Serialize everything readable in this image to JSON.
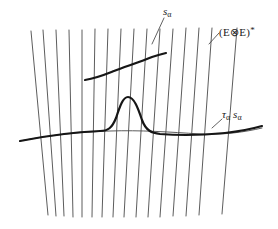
{
  "figure": {
    "background_color": "#ffffff",
    "fiber_line_color": "#4a4a4a",
    "curve_color": "#161616",
    "label_color": "#1a1a1a"
  },
  "labels": {
    "section": {
      "name": "s-alpha",
      "base": "s",
      "subscript": "α"
    },
    "bundle": {
      "name": "tensor-dual-bundle",
      "open_paren": "(",
      "first": "E",
      "tensor": "⊗",
      "second": "E",
      "close_paren": ")",
      "star": "*",
      "full": "(E ⊗ E)*"
    },
    "transformed_section": {
      "name": "tau-alpha-s-alpha",
      "tau": "τ",
      "tau_subscript": "α",
      "s": "s",
      "s_subscript": "α",
      "full": "τα sα"
    }
  },
  "geometry": {
    "fibers": [
      {
        "x_top": 31,
        "y_top": 31,
        "x_bottom": 48,
        "y_bottom": 215
      },
      {
        "x_top": 43,
        "y_top": 30,
        "x_bottom": 56,
        "y_bottom": 216
      },
      {
        "x_top": 56,
        "y_top": 30,
        "x_bottom": 64,
        "y_bottom": 216
      },
      {
        "x_top": 69,
        "y_top": 30,
        "x_bottom": 73,
        "y_bottom": 217
      },
      {
        "x_top": 82,
        "y_top": 30,
        "x_bottom": 82,
        "y_bottom": 217
      },
      {
        "x_top": 95,
        "y_top": 29,
        "x_bottom": 92,
        "y_bottom": 217
      },
      {
        "x_top": 108,
        "y_top": 29,
        "x_bottom": 102,
        "y_bottom": 217
      },
      {
        "x_top": 121,
        "y_top": 29,
        "x_bottom": 113,
        "y_bottom": 217
      },
      {
        "x_top": 134,
        "y_top": 29,
        "x_bottom": 124,
        "y_bottom": 217
      },
      {
        "x_top": 147,
        "y_top": 29,
        "x_bottom": 136,
        "y_bottom": 217
      },
      {
        "x_top": 160,
        "y_top": 29,
        "x_bottom": 148,
        "y_bottom": 217
      },
      {
        "x_top": 173,
        "y_top": 29,
        "x_bottom": 160,
        "y_bottom": 217
      },
      {
        "x_top": 186,
        "y_top": 28,
        "x_bottom": 173,
        "y_bottom": 216
      },
      {
        "x_top": 199,
        "y_top": 28,
        "x_bottom": 186,
        "y_bottom": 216
      },
      {
        "x_top": 212,
        "y_top": 28,
        "x_bottom": 199,
        "y_bottom": 215
      },
      {
        "x_top": 237,
        "y_top": 28,
        "x_bottom": 222,
        "y_bottom": 214
      }
    ],
    "section_curve": "M 85,80 C 97,78 104,75 114,71 C 124,67 140,62 152,57 C 158,55 162,54 166,53",
    "base_thin_curve": "M 20,141 C 50,135 80,132 110,131 C 140,130 170,132 200,134 C 225,135 245,132 262,128",
    "bump_curve": "M 20,141 C 50,135 78,132 100,131 C 108,131 112,128 116,118 C 120,106 123,97 128,97 C 134,97 138,108 142,120 C 146,131 152,133 160,134 C 185,136 205,135 225,133 C 242,131 255,128 262,126",
    "leaders": [
      {
        "name": "s-alpha-leader",
        "path": "M 164,18 L 152,44"
      },
      {
        "name": "bundle-leader",
        "path": "M 219,33 L 209,44"
      },
      {
        "name": "tau-leader",
        "path": "M 222,119 L 212,128"
      }
    ]
  }
}
